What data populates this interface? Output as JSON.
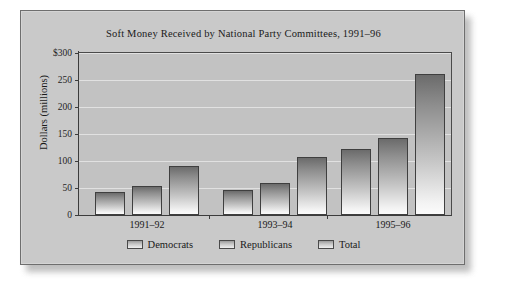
{
  "chart_data": {
    "type": "bar",
    "title": "Soft Money Received by National Party Committees, 1991–96",
    "xlabel": "",
    "ylabel": "Dollars (millions)",
    "categories": [
      "1991–92",
      "1993–94",
      "1995–96"
    ],
    "series": [
      {
        "name": "Democrats",
        "values": [
          42,
          46,
          122
        ]
      },
      {
        "name": "Republicans",
        "values": [
          53,
          60,
          142
        ]
      },
      {
        "name": "Total",
        "values": [
          90,
          108,
          262
        ]
      }
    ],
    "ylim": [
      0,
      300
    ],
    "ytick_values": [
      0,
      50,
      100,
      150,
      200,
      250,
      300
    ],
    "ytick_labels": [
      "0",
      "50",
      "100",
      "150",
      "200",
      "250",
      "$300"
    ],
    "grid": true,
    "legend_position": "bottom"
  },
  "colors": {
    "card_background": "#c9c9c9",
    "plot_background": "#c2c2c2",
    "gridline": "#e4e4e4",
    "axis": "#3c3c3c",
    "bar_top": "#6b6b6b",
    "bar_bottom": "#fbfbfb",
    "text": "#1a1a1a"
  }
}
